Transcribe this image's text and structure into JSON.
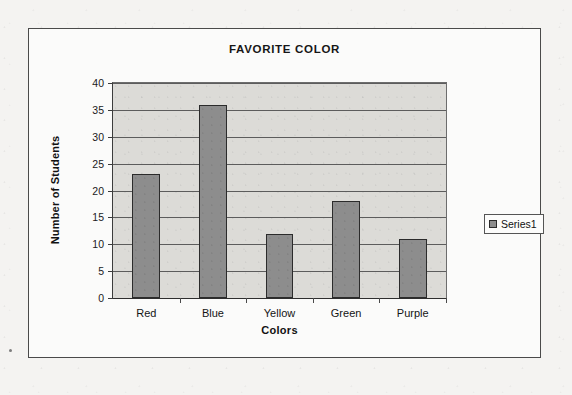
{
  "chart_data": {
    "type": "bar",
    "title": "FAVORITE COLOR",
    "xlabel": "Colors",
    "ylabel": "Number of Students",
    "categories": [
      "Red",
      "Blue",
      "Yellow",
      "Green",
      "Purple"
    ],
    "values": [
      23,
      36,
      12,
      18,
      11
    ],
    "series": [
      {
        "name": "Series1",
        "values": [
          23,
          36,
          12,
          18,
          11
        ]
      }
    ],
    "ylim": [
      0,
      40
    ],
    "ytick_labels": [
      "0",
      "5",
      "10",
      "15",
      "20",
      "25",
      "30",
      "35",
      "40"
    ],
    "ytick_values": [
      0,
      5,
      10,
      15,
      20,
      25,
      30,
      35,
      40
    ],
    "grid": true,
    "grid_axis": "y",
    "legend": [
      "Series1"
    ],
    "legend_position": "right",
    "bar_color": "#8d8d8d",
    "bar_border_color": "#2b2b2b",
    "plot_background": "#dcdbd7",
    "frame_background": "#fbfbfa"
  },
  "legend": {
    "entry_label": "Series1",
    "marker_name": "series-color-swatch"
  }
}
